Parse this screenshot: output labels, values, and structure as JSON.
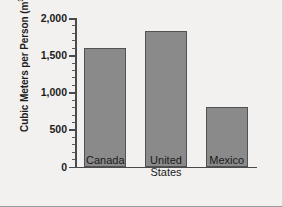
{
  "chart_data": {
    "type": "bar",
    "title": "",
    "xlabel": "",
    "ylabel": "Cubic Meters per Person (m³)",
    "ylabel_main": "Cubic Meters per Person (m",
    "ylabel_exponent": "3",
    "ylabel_tail": ")",
    "categories": [
      "Canada",
      "United\nStates",
      "Mexico"
    ],
    "values": [
      1600,
      1830,
      800
    ],
    "ylim": [
      0,
      2000
    ],
    "ytick_labels": [
      "0",
      "500",
      "1,000",
      "1,500",
      "2,000"
    ],
    "ytick_values": [
      0,
      500,
      1000,
      1500,
      2000
    ],
    "minor_tick_interval": 100,
    "grid": false,
    "legend": null,
    "bar_color": "#8a8a8a",
    "bar_edge_color": "#525252",
    "axis_color": "#4a4a4a",
    "background_color": "#f2f1ef"
  }
}
